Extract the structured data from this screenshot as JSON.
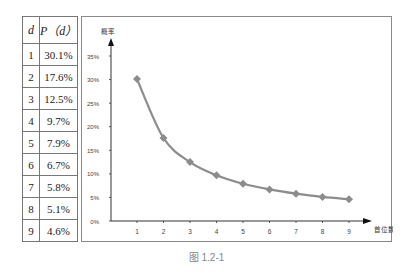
{
  "table": {
    "headers": [
      "d",
      "P（d）"
    ],
    "rows": [
      [
        "1",
        "30.1%"
      ],
      [
        "2",
        "17.6%"
      ],
      [
        "3",
        "12.5%"
      ],
      [
        "4",
        "9.7%"
      ],
      [
        "5",
        "7.9%"
      ],
      [
        "6",
        "6.7%"
      ],
      [
        "7",
        "5.8%"
      ],
      [
        "8",
        "5.1%"
      ],
      [
        "9",
        "4.6%"
      ]
    ]
  },
  "caption": "图 1.2-1",
  "colors": {
    "series": "#8c8c8c",
    "axis": "#333333",
    "frame": "#8a8a8a"
  },
  "chart_data": {
    "type": "line",
    "title": "",
    "xlabel": "首位数字",
    "ylabel": "概率",
    "x": [
      1,
      2,
      3,
      4,
      5,
      6,
      7,
      8,
      9
    ],
    "categories": [
      "1",
      "2",
      "3",
      "4",
      "5",
      "6",
      "7",
      "8",
      "9"
    ],
    "series": [
      {
        "name": "P(d)",
        "values": [
          30.1,
          17.6,
          12.5,
          9.7,
          7.9,
          6.7,
          5.8,
          5.1,
          4.6
        ]
      }
    ],
    "yticks": [
      "0%",
      "5%",
      "10%",
      "15%",
      "20%",
      "25%",
      "30%",
      "35%"
    ],
    "ylim": [
      0,
      35
    ],
    "grid": false,
    "legend": "none",
    "marker": "diamond"
  }
}
